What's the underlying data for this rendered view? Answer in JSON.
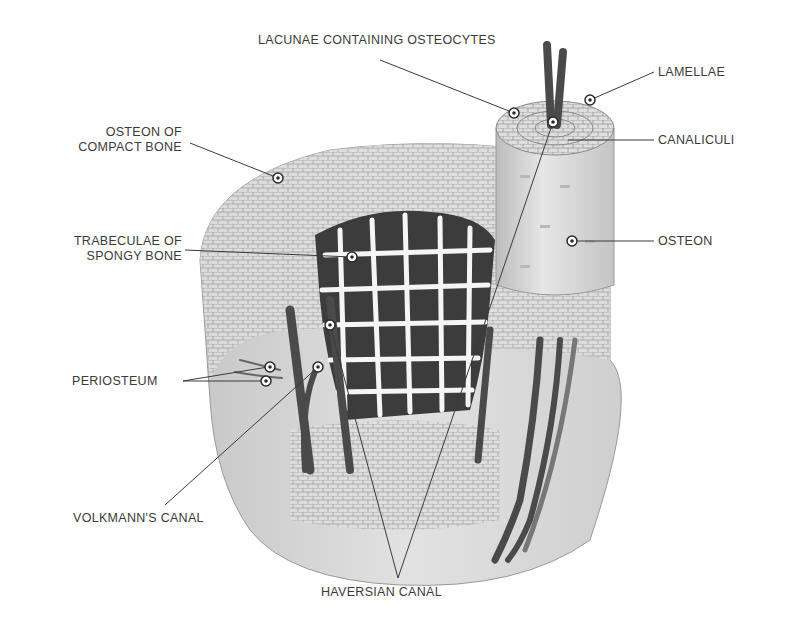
{
  "labels": {
    "lacunae": "LACUNAE CONTAINING OSTEOCYTES",
    "lamellae": "LAMELLAE",
    "canaliculi": "CANALICULI",
    "osteon": "OSTEON",
    "osteon_compact_line1": "OSTEON OF",
    "osteon_compact_line2": "COMPACT BONE",
    "trabeculae_line1": "TRABECULAE OF",
    "trabeculae_line2": "SPONGY BONE",
    "periosteum": "PERIOSTEUM",
    "volkmann": "VOLKMANN'S CANAL",
    "haversian": "HAVERSIAN CANAL"
  },
  "colors": {
    "bone_fill": "#d6d6d6",
    "bone_light": "#ececec",
    "spongy_dark": "#3c3c3c",
    "vessel": "#4a4a4a",
    "line": "#3a3a3a"
  }
}
